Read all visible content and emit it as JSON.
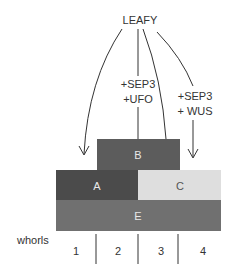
{
  "diagram": {
    "title": "LEAFY",
    "cofactors_center": [
      "+SEP3",
      "+UFO"
    ],
    "cofactors_right": [
      "+SEP3",
      "+ WUS"
    ],
    "boxes": {
      "B": {
        "label": "B",
        "color": "#5c5c5c"
      },
      "A": {
        "label": "A",
        "color": "#4b4b4b"
      },
      "C": {
        "label": "C",
        "color": "#dedede"
      },
      "E": {
        "label": "E",
        "color": "#707070"
      }
    },
    "whorls_label": "whorls",
    "whorls": [
      "1",
      "2",
      "3",
      "4"
    ]
  }
}
